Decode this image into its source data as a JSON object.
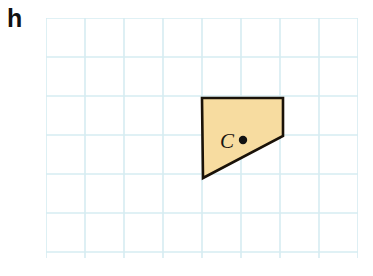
{
  "exercise": {
    "label": "h"
  },
  "colors": {
    "grid_line": "#d6ecf2",
    "shape_fill": "#f7dca0",
    "shape_stroke": "#1a1208",
    "point_color": "#111111",
    "background": "#ffffff"
  },
  "grid": {
    "cell_size": 39,
    "columns": 8,
    "rows": 6,
    "origin_x": 46,
    "origin_y": 18,
    "width": 312,
    "height": 240,
    "line_width": 1.6,
    "visible": true
  },
  "figure": {
    "name": "quadrilateral-c",
    "shape_type": "quadrilateral",
    "points_attr": "156,80 237,80 237,118 157,160",
    "vertices": [
      {
        "name": "top-left",
        "x": 156,
        "y": 80
      },
      {
        "name": "top-right",
        "x": 237,
        "y": 80
      },
      {
        "name": "right",
        "x": 237,
        "y": 118
      },
      {
        "name": "bottom-left",
        "x": 157,
        "y": 160
      }
    ],
    "stroke_width": 2.6
  },
  "marked_point": {
    "label": "C",
    "label_x": 174,
    "label_y": 130,
    "dot_x": 197,
    "dot_y": 122,
    "dot_radius": 4.2
  }
}
